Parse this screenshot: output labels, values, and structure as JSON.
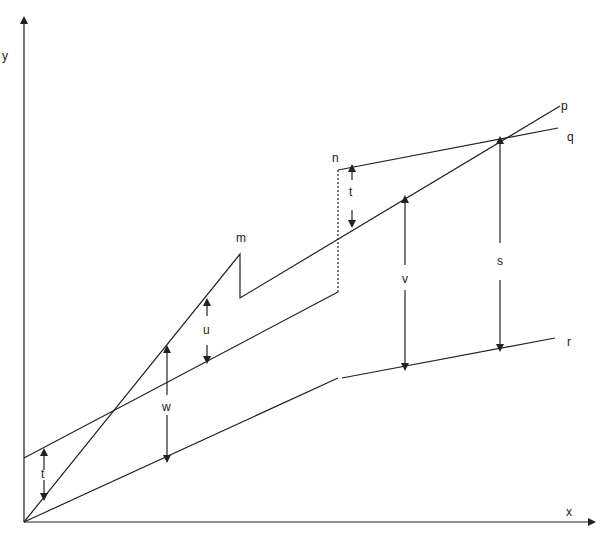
{
  "axes": {
    "x_label": "x",
    "y_label": "y"
  },
  "line_labels": {
    "p": "p",
    "q": "q",
    "r": "r"
  },
  "point_labels": {
    "m": "m",
    "n": "n"
  },
  "gap_labels": {
    "t_left": "t",
    "t_mid": "t",
    "u": "u",
    "w": "w",
    "v": "v",
    "s": "s"
  },
  "colors": {
    "line": "#222222",
    "background": "#ffffff"
  }
}
